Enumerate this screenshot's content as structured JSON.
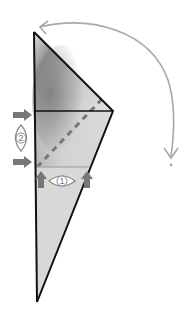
{
  "diagram": {
    "type": "origami-fold-step",
    "colors": {
      "outline": "#111111",
      "paper_light": "#d9d9d9",
      "paper_shadow": "#8a8a8a",
      "crease_line": "#777777",
      "fold_arrow": "#a8a8a8",
      "push_arrow": "#777777",
      "lens_stroke": "#888888"
    },
    "shape": {
      "top_vertex": [
        34,
        32
      ],
      "right_vertex": [
        113,
        111
      ],
      "bottom_vertex": [
        37,
        302
      ],
      "upper_horizontal_y": 111,
      "lower_horizontal_y": 167
    },
    "annotations": {
      "lens_1_label": "1",
      "lens_2_label": "2"
    },
    "arrows": {
      "fold_arc": "curved fold arrow from top vertex swinging clockwise down to the right",
      "left_push_arrows": 2,
      "bottom_push_arrows": 2
    }
  }
}
